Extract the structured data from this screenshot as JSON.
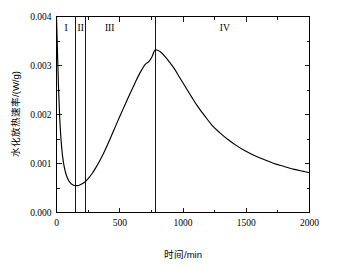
{
  "chart_data": {
    "type": "line",
    "title": "",
    "xlabel": "时间/min",
    "ylabel": "水化放热速率/(W/g)",
    "xlim": [
      0,
      2000
    ],
    "ylim": [
      0,
      0.004
    ],
    "grid": false,
    "legend": null,
    "x_ticks": [
      0,
      500,
      1000,
      1500,
      2000
    ],
    "x_tick_labels": [
      "0",
      "500",
      "1000",
      "1500",
      "2000"
    ],
    "x_minor_ticks": [
      250,
      750,
      1250,
      1750
    ],
    "y_ticks": [
      0,
      0.001,
      0.002,
      0.003,
      0.004
    ],
    "y_tick_labels": [
      "0.000",
      "0.001",
      "0.002",
      "0.003",
      "0.004"
    ],
    "y_minor_ticks": [
      0.0005,
      0.0015,
      0.0025,
      0.0035
    ],
    "series": [
      {
        "name": "水化放热速率",
        "x": [
          0,
          8,
          16,
          25,
          35,
          48,
          62,
          78,
          95,
          115,
          135,
          155,
          175,
          200,
          225,
          250,
          280,
          310,
          345,
          380,
          420,
          460,
          500,
          540,
          580,
          620,
          660,
          700,
          730,
          755,
          770,
          782,
          800,
          825,
          855,
          890,
          930,
          975,
          1020,
          1070,
          1120,
          1175,
          1230,
          1290,
          1350,
          1420,
          1490,
          1560,
          1640,
          1720,
          1800,
          1880,
          1950,
          2000
        ],
        "y": [
          0.004,
          0.00325,
          0.00255,
          0.00195,
          0.00152,
          0.00115,
          0.00092,
          0.00076,
          0.00066,
          0.00059,
          0.000558,
          0.000548,
          0.000552,
          0.00058,
          0.000625,
          0.00069,
          0.00079,
          0.00091,
          0.00107,
          0.00125,
          0.00148,
          0.00172,
          0.00196,
          0.00219,
          0.00242,
          0.00264,
          0.00285,
          0.00302,
          0.00308,
          0.00318,
          0.00328,
          0.00332,
          0.00331,
          0.00327,
          0.00319,
          0.00308,
          0.00294,
          0.00275,
          0.00256,
          0.00235,
          0.00215,
          0.00196,
          0.00178,
          0.00163,
          0.0015,
          0.00137,
          0.00126,
          0.00117,
          0.00108,
          0.001,
          0.00094,
          0.00088,
          0.00084,
          0.00081
        ]
      }
    ],
    "regions": [
      {
        "id": "region-1",
        "label": "I",
        "x_start": 0,
        "x_end": 150,
        "label_x": 75
      },
      {
        "id": "region-2",
        "label": "II",
        "x_start": 150,
        "x_end": 232,
        "label_x": 191
      },
      {
        "id": "region-3",
        "label": "III",
        "x_start": 232,
        "x_end": 780,
        "label_x": 420
      },
      {
        "id": "region-4",
        "label": "IV",
        "x_start": 780,
        "x_end": 2000,
        "label_x": 1330
      }
    ],
    "region_dividers": [
      150,
      232,
      780
    ],
    "annotations": {
      "peak_x": 782,
      "peak_y": 0.00332,
      "minimum_x": 160,
      "minimum_y": 0.00055,
      "end_y": 0.00081
    },
    "colors": {
      "curve": "#000000",
      "axis": "#000000",
      "background": "#ffffff"
    }
  }
}
